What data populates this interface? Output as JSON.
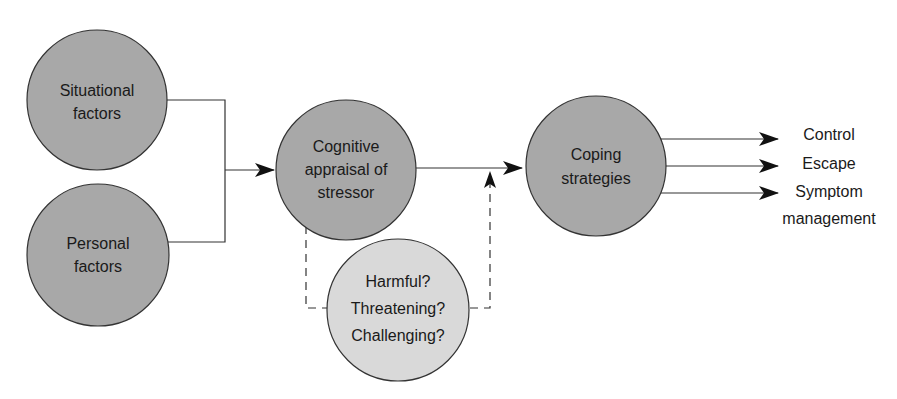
{
  "diagram": {
    "nodes": {
      "situational": {
        "line1": "Situational",
        "line2": "factors"
      },
      "personal": {
        "line1": "Personal",
        "line2": "factors"
      },
      "appraisal": {
        "line1": "Cognitive",
        "line2": "appraisal of",
        "line3": "stressor"
      },
      "questions": {
        "line1": "Harmful?",
        "line2": "Threatening?",
        "line3": "Challenging?"
      },
      "coping": {
        "line1": "Coping",
        "line2": "strategies"
      }
    },
    "outputs": {
      "control": "Control",
      "escape": "Escape",
      "symptom_line1": "Symptom",
      "symptom_line2": "management"
    },
    "colors": {
      "dark_node": "#a8a8a8",
      "light_node": "#d9d9d9",
      "stroke": "#333333"
    }
  }
}
